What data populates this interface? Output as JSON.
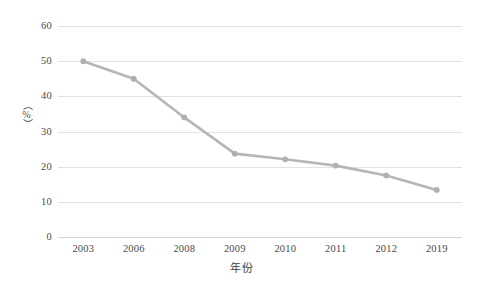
{
  "chart_data": {
    "type": "line",
    "title": "",
    "subtitle": "",
    "xlabel": "年份",
    "ylabel": "（%）",
    "categories": [
      "2003",
      "2006",
      "2008",
      "2009",
      "2010",
      "2011",
      "2012",
      "2019"
    ],
    "values": [
      50.0,
      45.0,
      34.0,
      23.7,
      22.1,
      20.3,
      17.5,
      13.4
    ],
    "series": [
      {
        "name": "",
        "values": [
          50.0,
          45.0,
          34.0,
          23.7,
          22.1,
          20.3,
          17.5,
          13.4
        ]
      }
    ],
    "ylim": [
      0,
      60
    ],
    "ytick_labels": [
      "0",
      "10",
      "20",
      "30",
      "40",
      "50",
      "60"
    ],
    "ytick_values": [
      0,
      10,
      20,
      30,
      40,
      50,
      60
    ],
    "xtick_labels": [
      "2003",
      "2006",
      "2008",
      "2009",
      "2010",
      "2011",
      "2012",
      "2019"
    ],
    "grid": "horizontal",
    "legend": "none",
    "annotations": [],
    "colors": {
      "series_line": "#b6b6b6",
      "marker": "#b0b0b0",
      "gridline": "#e2e2e2",
      "baseline": "#d6d6d6",
      "background": "#ffffff",
      "text": "#4a4a4a"
    }
  }
}
